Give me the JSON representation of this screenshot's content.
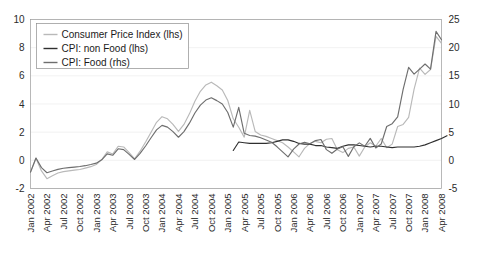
{
  "chart_data": {
    "type": "line",
    "title": "",
    "subtitle": "",
    "xlabel": "",
    "ylabel": "",
    "y2label": "",
    "grid": false,
    "legend_position": "top-left",
    "ylim": [
      -2,
      10
    ],
    "y2lim": [
      -5,
      25
    ],
    "yticks": [
      "10",
      "8",
      "6",
      "4",
      "2",
      "0",
      "-2"
    ],
    "ytick_values": [
      10,
      8,
      6,
      4,
      2,
      0,
      -2
    ],
    "y2ticks": [
      "25",
      "20",
      "15",
      "10",
      "5",
      "0",
      "-5"
    ],
    "y2tick_values": [
      25,
      20,
      15,
      10,
      5,
      0,
      -5
    ],
    "xtick_labels": [
      "Jan 2002",
      "Apr 2002",
      "Jul 2002",
      "Oct 2002",
      "Jan 2003",
      "Apr 2003",
      "Jul 2003",
      "Oct 2003",
      "Jan 2004",
      "Apr 2004",
      "Jul 2004",
      "Oct 2004",
      "Jan 2005",
      "Apr 2005",
      "Jul 2005",
      "Oct 2005",
      "Jan 2006",
      "Apr 2006",
      "Jul 2006",
      "Oct 2006",
      "Jan 2007",
      "Apr 2007",
      "Jul 2007",
      "Oct 2007",
      "Jan 2008",
      "Apr 2008"
    ],
    "xtick_indices": [
      0,
      3,
      6,
      9,
      12,
      15,
      18,
      21,
      24,
      27,
      30,
      33,
      36,
      39,
      42,
      45,
      48,
      51,
      54,
      57,
      60,
      63,
      66,
      69,
      72,
      75
    ],
    "x_count": 76,
    "series": [
      {
        "name": "Consumer Price Index (lhs)",
        "axis": "left",
        "color": "#b9b9b9",
        "start_index": 0,
        "values": [
          -0.85,
          0.15,
          -0.75,
          -1.3,
          -1.1,
          -0.9,
          -0.8,
          -0.75,
          -0.7,
          -0.65,
          -0.55,
          -0.45,
          -0.3,
          0.05,
          0.6,
          0.45,
          1.0,
          0.95,
          0.55,
          0.1,
          0.65,
          1.3,
          2.0,
          2.7,
          3.1,
          2.95,
          2.55,
          2.05,
          2.55,
          3.3,
          4.2,
          4.9,
          5.35,
          5.55,
          5.3,
          5.0,
          4.25,
          2.95,
          2.35,
          1.65,
          3.55,
          2.05,
          1.8,
          1.7,
          1.55,
          1.4,
          1.25,
          0.95,
          0.6,
          0.25,
          0.85,
          1.2,
          1.35,
          1.25,
          1.5,
          1.55,
          0.75,
          0.55,
          0.85,
          0.95,
          0.3,
          0.95,
          1.25,
          1.0,
          1.55,
          0.9,
          1.15,
          2.4,
          2.55,
          3.05,
          5.05,
          6.55,
          6.1,
          6.45,
          8.8,
          8.3
        ]
      },
      {
        "name": "CPI: non Food (lhs)",
        "axis": "left",
        "color": "#2f2f2f",
        "start_index": 37,
        "values": [
          0.7,
          1.3,
          1.25,
          1.2,
          1.2,
          1.2,
          1.2,
          1.25,
          1.35,
          1.45,
          1.45,
          1.35,
          1.2,
          1.15,
          1.15,
          1.05,
          1.05,
          0.95,
          0.9,
          0.85,
          1.0,
          1.1,
          1.1,
          1.05,
          1.0,
          0.95,
          1.0,
          1.0,
          0.95,
          0.9,
          0.95,
          0.95,
          0.95,
          0.95,
          1.0,
          1.1,
          1.25,
          1.4,
          1.55,
          1.75
        ]
      },
      {
        "name": "CPI: Food (rhs)",
        "axis": "right",
        "color": "#6e6e6e",
        "start_index": 0,
        "values": [
          -2.1,
          0.4,
          -1.3,
          -2.2,
          -1.9,
          -1.6,
          -1.4,
          -1.3,
          -1.2,
          -1.1,
          -0.95,
          -0.75,
          -0.5,
          0.1,
          1.15,
          0.9,
          2.05,
          1.9,
          1.05,
          0.15,
          1.25,
          2.55,
          4.0,
          5.4,
          6.2,
          5.9,
          5.1,
          4.1,
          5.1,
          6.6,
          8.4,
          9.8,
          10.7,
          11.1,
          10.6,
          10.0,
          8.5,
          5.9,
          9.4,
          4.8,
          4.4,
          4.3,
          4.0,
          3.6,
          3.2,
          2.4,
          1.5,
          0.6,
          2.0,
          2.9,
          3.2,
          2.95,
          3.5,
          3.7,
          1.9,
          1.25,
          2.0,
          2.4,
          0.7,
          2.4,
          3.1,
          2.5,
          3.9,
          2.2,
          2.9,
          6.0,
          6.5,
          7.7,
          12.6,
          16.5,
          15.3,
          16.2,
          17.1,
          16.2,
          22.9,
          21.4
        ]
      }
    ]
  },
  "legend": {
    "items": [
      {
        "label": "Consumer Price Index (lhs)",
        "color": "#b9b9b9"
      },
      {
        "label": "CPI: non Food (lhs)",
        "color": "#2f2f2f"
      },
      {
        "label": "CPI: Food (rhs)",
        "color": "#6e6e6e"
      }
    ]
  }
}
